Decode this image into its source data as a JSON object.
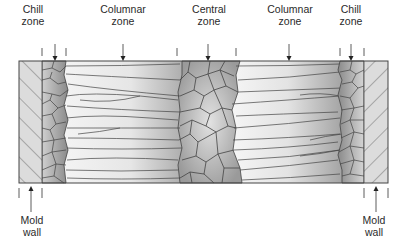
{
  "labels": {
    "top": [
      {
        "id": "chill-left",
        "line1": "Chill",
        "line2": "zone",
        "x": 33
      },
      {
        "id": "columnar-left",
        "line1": "Columnar",
        "line2": "zone",
        "x": 123
      },
      {
        "id": "central",
        "line1": "Central",
        "line2": "zone",
        "x": 209
      },
      {
        "id": "columnar-right",
        "line1": "Columnar",
        "line2": "zone",
        "x": 290
      },
      {
        "id": "chill-right",
        "line1": "Chill",
        "line2": "zone",
        "x": 351
      }
    ],
    "bottom": [
      {
        "id": "mold-left",
        "line1": "Mold",
        "line2": "wall",
        "x": 32
      },
      {
        "id": "mold-right",
        "line1": "Mold",
        "line2": "wall",
        "x": 374
      }
    ]
  },
  "colors": {
    "mold_fill": "#d9d9d9",
    "hatch": "#555555",
    "chill_grain": "#8c8c8c",
    "columnar_dark": "#a8a8a8",
    "columnar_light": "#f2f2f2",
    "central_grain": "#b5b5b5",
    "outline": "#444444"
  }
}
